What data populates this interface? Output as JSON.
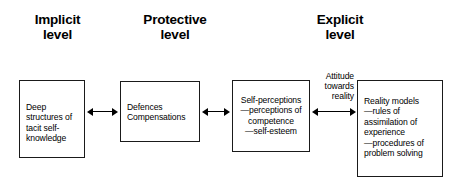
{
  "diagram": {
    "title_headings": [
      {
        "name": "implicit",
        "text": "Implicit\nlevel"
      },
      {
        "name": "protective",
        "text": "Protective\nlevel"
      },
      {
        "name": "explicit",
        "text": "Explicit\nlevel"
      }
    ],
    "boxes": [
      {
        "name": "deep-structures",
        "text": "Deep\nstructures of\ntacit self-\nknowledge"
      },
      {
        "name": "defences",
        "text": "Defences\nCompensations"
      },
      {
        "name": "self-perceptions",
        "text": "Self-perceptions\n—perceptions of\ncompetence\n—self-esteem"
      },
      {
        "name": "reality-models",
        "text": "Reality models\n—rules of\nassimilation of\nexperience\n—procedures of\nproblem solving"
      }
    ],
    "connector_label": "Attitude\ntowards\nreality",
    "arrows": [
      {
        "name": "arrow-implicit-protective",
        "direction": "bidirectional"
      },
      {
        "name": "arrow-protective-explicit",
        "direction": "bidirectional"
      },
      {
        "name": "arrow-selfperceptions-realitymodels",
        "direction": "bidirectional"
      }
    ],
    "colors": {
      "stroke": "#1a1a1a",
      "background": "#ffffff",
      "text": "#000000"
    }
  }
}
